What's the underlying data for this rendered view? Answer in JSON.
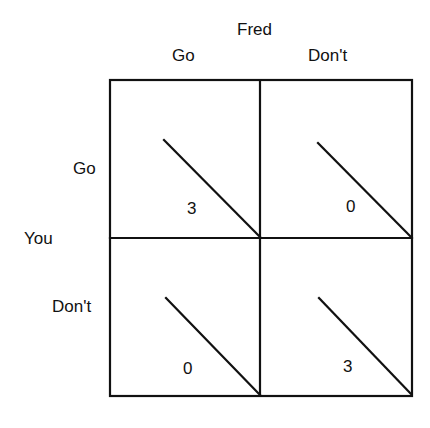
{
  "matrix": {
    "column_player": "Fred",
    "row_player": "You",
    "column_strategies": [
      "Go",
      "Don't"
    ],
    "row_strategies": [
      "Go",
      "Don't"
    ],
    "payoffs": [
      [
        "3",
        "0"
      ],
      [
        "0",
        "3"
      ]
    ]
  }
}
